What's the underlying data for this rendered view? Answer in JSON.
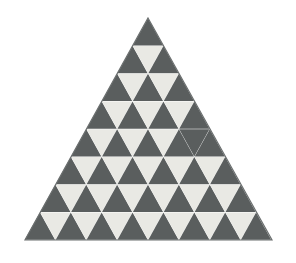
{
  "figure": {
    "kind": "geometric-pattern",
    "background_color": "#ffffff",
    "dark_color": "#5a5e5e",
    "light_color": "#e9e9e4",
    "edge_color": "#6b6f6f",
    "rows": 8,
    "apex": {
      "x": 148,
      "y": 18
    },
    "base_left": {
      "x": 25,
      "y": 240
    },
    "base_right": {
      "x": 272,
      "y": 240
    },
    "cell_width": 30.875,
    "row_height": 27.75
  },
  "chart_data": {
    "type": "heatmap",
    "xlabel": "",
    "ylabel": "",
    "categories": [
      "row 1",
      "row 2",
      "row 3",
      "row 4",
      "row 5",
      "row 6",
      "row 7",
      "row 8"
    ],
    "values": [
      1,
      3,
      5,
      7,
      9,
      11,
      13,
      15
    ],
    "legend": [
      "dark (up)",
      "light (down)"
    ],
    "grid": false,
    "rows": [
      {
        "index": 1,
        "count": 1,
        "cells": [
          "dark"
        ]
      },
      {
        "index": 2,
        "count": 3,
        "cells": [
          "dark",
          "light",
          "dark"
        ]
      },
      {
        "index": 3,
        "count": 5,
        "cells": [
          "dark",
          "light",
          "dark",
          "light",
          "dark"
        ]
      },
      {
        "index": 4,
        "count": 7,
        "cells": [
          "dark",
          "light",
          "dark",
          "light",
          "dark",
          "light",
          "dark"
        ]
      },
      {
        "index": 5,
        "count": 9,
        "cells": [
          "dark",
          "light",
          "dark",
          "light",
          "dark",
          "light",
          "dark",
          "dark",
          "dark"
        ]
      },
      {
        "index": 6,
        "count": 11,
        "cells": [
          "dark",
          "light",
          "dark",
          "light",
          "dark",
          "light",
          "dark",
          "light",
          "dark",
          "light",
          "dark"
        ]
      },
      {
        "index": 7,
        "count": 13,
        "cells": [
          "dark",
          "light",
          "dark",
          "light",
          "dark",
          "light",
          "dark",
          "light",
          "dark",
          "light",
          "dark",
          "light",
          "dark"
        ]
      },
      {
        "index": 8,
        "count": 15,
        "cells": [
          "dark",
          "light",
          "dark",
          "light",
          "dark",
          "light",
          "dark",
          "light",
          "dark",
          "light",
          "dark",
          "light",
          "dark",
          "light",
          "dark"
        ]
      }
    ]
  }
}
